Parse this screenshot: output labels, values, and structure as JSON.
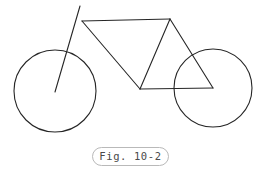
{
  "figure": {
    "caption": "Fig. 10-2",
    "background_color": "#ffffff",
    "stroke_color": "#262626",
    "caption_border_color": "#b9b9b9",
    "caption_text_color": "#4a4a4a"
  },
  "diagram_data": {
    "type": "line-drawing",
    "subject": "bicycle",
    "canvas": {
      "width": 261,
      "height": 178
    },
    "circles": [
      {
        "name": "rear-wheel",
        "cx": 55,
        "cy": 91,
        "r": 41
      },
      {
        "name": "front-wheel",
        "cx": 213,
        "cy": 88,
        "r": 39
      }
    ],
    "lines": [
      {
        "name": "seat-post-fork",
        "x1": 80,
        "y1": 6,
        "x2": 55,
        "y2": 92
      },
      {
        "name": "top-tube",
        "x1": 82,
        "y1": 21,
        "x2": 170,
        "y2": 19
      },
      {
        "name": "down-tube",
        "x1": 82,
        "y1": 21,
        "x2": 140,
        "y2": 89
      },
      {
        "name": "seat-tube",
        "x1": 170,
        "y1": 19,
        "x2": 140,
        "y2": 89
      },
      {
        "name": "seat-stay",
        "x1": 170,
        "y1": 19,
        "x2": 213,
        "y2": 88
      },
      {
        "name": "chain-stay",
        "x1": 140,
        "y1": 89,
        "x2": 213,
        "y2": 88
      }
    ],
    "junctions": [
      {
        "name": "head-junction",
        "x": 82,
        "y": 21
      },
      {
        "name": "seat-junction",
        "x": 170,
        "y": 19
      },
      {
        "name": "bottom-bracket",
        "x": 140,
        "y": 89
      }
    ]
  }
}
